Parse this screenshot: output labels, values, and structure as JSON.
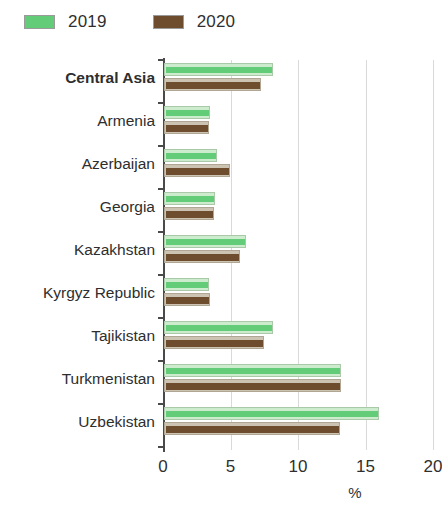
{
  "chart_data": {
    "type": "bar",
    "orientation": "horizontal",
    "title": "",
    "xlabel": "%",
    "ylabel": "",
    "xlim": [
      0,
      20
    ],
    "xticks": [
      "0",
      "5",
      "10",
      "15",
      "20"
    ],
    "xtick_values": [
      0,
      5,
      10,
      15,
      20
    ],
    "grid": "vertical",
    "legend_position": "top-left",
    "categories": [
      "Central Asia",
      "Armenia",
      "Azerbaijan",
      "Georgia",
      "Kazakhstan",
      "Kyrgyz Republic",
      "Tajikistan",
      "Turkmenistan",
      "Uzbekistan"
    ],
    "emphasized_categories": [
      "Central Asia"
    ],
    "series": [
      {
        "name": "2019",
        "color": "#63cc79",
        "values": [
          8.1,
          3.4,
          3.9,
          3.8,
          6.1,
          3.3,
          8.1,
          13.1,
          15.9
        ]
      },
      {
        "name": "2020",
        "color": "#6e4d2f",
        "values": [
          7.2,
          3.3,
          4.9,
          3.7,
          5.6,
          3.4,
          7.4,
          13.1,
          13.0
        ]
      }
    ]
  },
  "legend": {
    "items": [
      {
        "label": "2019",
        "color": "#63cc79"
      },
      {
        "label": "2020",
        "color": "#6e4d2f"
      }
    ]
  },
  "axis": {
    "x_title": "%"
  }
}
